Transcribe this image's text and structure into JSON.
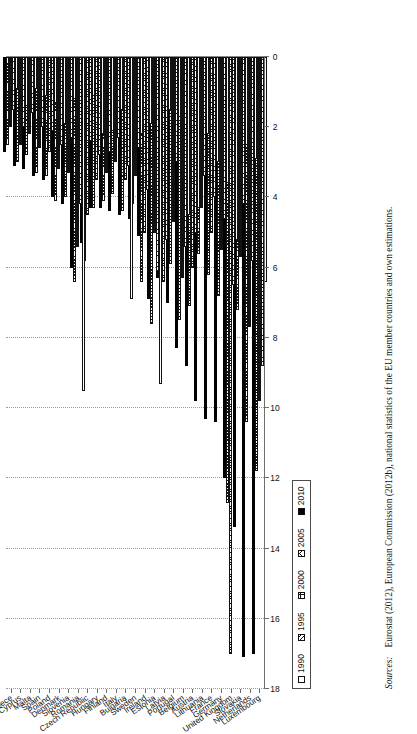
{
  "figure": {
    "sources_label": "Sources:",
    "sources_text": "Eurostat (2012), European Commission (2012b), national statistics of the EU member countries and own estimations."
  },
  "legend": {
    "position": "bottom-left",
    "items": [
      {
        "label": "1990",
        "pattern": "p1990",
        "swatch": "white-open-square"
      },
      {
        "label": "1995",
        "pattern": "p1995",
        "swatch": "diagonal-hatch-square"
      },
      {
        "label": "2000",
        "pattern": "p2000",
        "swatch": "dotted-grid-square"
      },
      {
        "label": "2005",
        "pattern": "p2005",
        "swatch": "cross-hatch-square"
      },
      {
        "label": "2010",
        "pattern": "p2010",
        "swatch": "solid-black-square"
      }
    ]
  },
  "chart_data": {
    "type": "bar",
    "orientation": "horizontal",
    "title": "",
    "subtitle": "",
    "xlabel": "",
    "ylabel": "",
    "xlim": [
      0,
      18
    ],
    "xticks": [
      0,
      2,
      4,
      6,
      8,
      10,
      12,
      14,
      16,
      18
    ],
    "xtick_labels": [
      "0",
      "2",
      "4",
      "6",
      "8",
      "10",
      "12",
      "14",
      "16",
      "18"
    ],
    "grid": true,
    "legend_entries": [
      "1990",
      "1995",
      "2000",
      "2005",
      "2010"
    ],
    "categories": [
      "Luxembourg",
      "Netherlands",
      "Slovakia",
      "United Kingdom",
      "Germany",
      "France",
      "Lithuania",
      "Austria",
      "Belgium",
      "Portugal",
      "Latvia",
      "Estonia",
      "Ireland",
      "Sweden",
      "Bulgaria",
      "Italy",
      "Finland",
      "Hungary",
      "Czech Republic",
      "Romania",
      "Slovenia",
      "Denmark",
      "Poland",
      "Spain",
      "Malta",
      "Cyprus",
      "Greece"
    ],
    "series": [
      {
        "name": "1990",
        "values": [
          6.4,
          2.9,
          2.5,
          5.2,
          3.6,
          3.0,
          2.2,
          4.3,
          4.5,
          1.7,
          1.5,
          9.3,
          1.9,
          2.2,
          6.9,
          1.5,
          2.1,
          2.2,
          1.1,
          9.5,
          1.2,
          1.9,
          1.3,
          1.1,
          0.9,
          1.4,
          0.9
        ]
      },
      {
        "name": "1995",
        "values": [
          8.8,
          5.8,
          4.2,
          6.5,
          4.6,
          4.0,
          3.4,
          5.0,
          5.4,
          3.0,
          5.2,
          6.1,
          3.8,
          2.6,
          3.1,
          2.3,
          2.7,
          2.8,
          2.4,
          4.2,
          2.3,
          2.5,
          2.1,
          2.0,
          1.6,
          2.0,
          1.5
        ]
      },
      {
        "name": "2000",
        "values": [
          9.8,
          7.7,
          5.7,
          17.0,
          5.5,
          5.0,
          4.3,
          6.0,
          6.3,
          4.7,
          6.4,
          5.0,
          5.0,
          3.4,
          3.5,
          3.0,
          3.3,
          3.5,
          4.5,
          5.4,
          3.3,
          3.2,
          2.7,
          2.6,
          2.2,
          2.5,
          2.0
        ]
      },
      {
        "name": "2005",
        "values": [
          11.8,
          10.4,
          7.2,
          12.7,
          6.8,
          6.2,
          5.6,
          7.1,
          7.5,
          5.9,
          6.9,
          7.6,
          6.4,
          4.2,
          4.4,
          3.9,
          4.1,
          4.3,
          5.8,
          6.4,
          4.0,
          4.1,
          3.4,
          3.3,
          2.8,
          3.0,
          2.5
        ]
      },
      {
        "name": "2010",
        "values": [
          17.0,
          17.1,
          13.4,
          12.0,
          10.4,
          10.3,
          9.8,
          8.8,
          8.3,
          7.0,
          6.3,
          6.9,
          5.1,
          4.6,
          4.5,
          4.4,
          4.3,
          4.3,
          5.3,
          6.0,
          4.2,
          4.0,
          3.5,
          3.4,
          3.2,
          3.1,
          2.7
        ]
      }
    ]
  }
}
